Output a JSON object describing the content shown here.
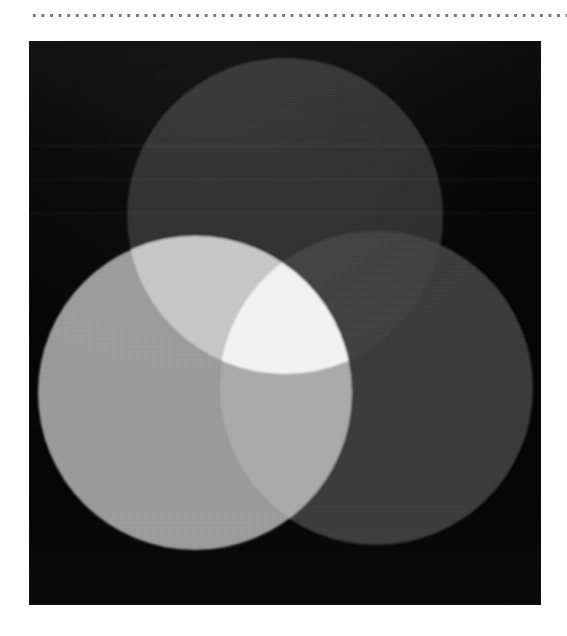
{
  "page": {
    "width": 567,
    "height": 636,
    "background_color": "#ffffff"
  },
  "separator": {
    "style": "dotted-rule",
    "dot_color": "#6d6d6d",
    "x": 30,
    "y": 16,
    "width": 537
  },
  "figure": {
    "caption": "",
    "panel": {
      "x": 30,
      "y": 42,
      "width": 510,
      "height": 562,
      "background_color": "#050505"
    }
  },
  "chart_data": {
    "type": "diagram",
    "subtype": "venn",
    "title": "",
    "subtitle": "",
    "xlabel": "",
    "ylabel": "",
    "grid": false,
    "legend_position": "none",
    "background_color": "#050505",
    "blend_mode": "additive (screen) light mixing, rendered in grayscale",
    "set_count": 3,
    "viewbox": {
      "width": 510,
      "height": 562
    },
    "sets": [
      {
        "name": "top",
        "label": "",
        "cx": 255,
        "cy": 174,
        "r": 158,
        "fill": "#2e2e2e",
        "luminance": 46
      },
      {
        "name": "left",
        "label": "",
        "cx": 165,
        "cy": 351,
        "r": 157,
        "fill": "#9a9a9a",
        "luminance": 154
      },
      {
        "name": "right",
        "label": "",
        "cx": 346,
        "cy": 346,
        "r": 157,
        "fill": "#3a3a3a",
        "luminance": 58
      }
    ],
    "intersections": [
      {
        "name": "top-left",
        "members": [
          "top",
          "left"
        ],
        "fill": "#c6c6c6",
        "luminance": 198
      },
      {
        "name": "top-right",
        "members": [
          "top",
          "right"
        ],
        "fill": "#3f3f3f",
        "luminance": 63
      },
      {
        "name": "left-right",
        "members": [
          "left",
          "right"
        ],
        "fill": "#a9a9a9",
        "luminance": 169
      },
      {
        "name": "top-left-right",
        "members": [
          "top",
          "left",
          "right"
        ],
        "fill": "#f2f2f2",
        "luminance": 242
      }
    ]
  }
}
